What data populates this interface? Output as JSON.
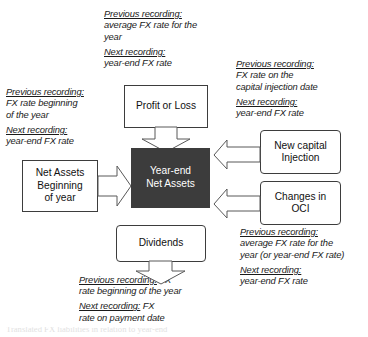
{
  "diagram": {
    "colors": {
      "center_box_fill": "#3c3c3c",
      "center_box_text": "#ffffff",
      "box_border": "#3d3d3d",
      "arrow_fill": "#ffffff",
      "arrow_stroke": "#585858",
      "background": "#ffffff",
      "text": "#1a1a1a"
    },
    "boxes": {
      "profit_or_loss": "Profit or Loss",
      "net_assets_beginning": "Net Assets\nBeginning\nof year",
      "net_assets_beginning_lines": [
        "Net Assets",
        "Beginning",
        "of year"
      ],
      "year_end_net_assets_lines": [
        "Year-end",
        "Net Assets"
      ],
      "new_capital_injection_lines": [
        "New capital",
        "Injection"
      ],
      "changes_in_oci_lines": [
        "Changes in",
        "OCI"
      ],
      "dividends": "Dividends"
    },
    "notes": {
      "profit_or_loss": {
        "previous_label": "Previous recording:",
        "previous_value_line1": "average FX rate for the",
        "previous_value_line2": "year",
        "next_label": "Next recording:",
        "next_value": "year-end FX rate"
      },
      "net_assets_beginning": {
        "previous_label": "Previous recording:",
        "previous_value_line1": "FX rate beginning",
        "previous_value_line2": "of the year",
        "next_label": "Next recording:",
        "next_value": "year-end FX rate"
      },
      "new_capital_injection": {
        "previous_label": "Previous recording:",
        "previous_value_line1": "FX rate on the",
        "previous_value_line2": "capital injection date",
        "next_label": "Next recording:",
        "next_value": "year-end FX rate"
      },
      "changes_in_oci": {
        "previous_label": "Previous recording:",
        "previous_value_line1": "average FX rate for the",
        "previous_value_line2": "year (or year-end FX rate)",
        "next_label": "Next recording:",
        "next_value": "year-end FX rate"
      },
      "dividends": {
        "previous_label": "Previous recording:",
        "previous_value_line1": "FX",
        "previous_value_line2": "rate beginning of the year",
        "next_label": "Next recording:",
        "next_value_line1": "FX",
        "next_value_line2": "rate on payment date"
      }
    },
    "caption": {
      "cropped_text": "Translated FX liabilities in relation to year-end"
    }
  }
}
